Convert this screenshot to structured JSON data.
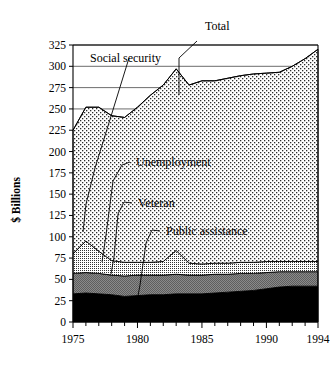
{
  "chart_data": {
    "type": "area",
    "stacked": true,
    "title": "",
    "subtitle": "",
    "xlabel": "",
    "ylabel": "$ Billions",
    "xlim": [
      1975,
      1994
    ],
    "ylim": [
      0,
      325
    ],
    "grid": true,
    "grid_axis": "y",
    "legend_position": "inline-annotations",
    "x": [
      1975,
      1976,
      1977,
      1978,
      1979,
      1980,
      1981,
      1982,
      1983,
      1984,
      1985,
      1986,
      1987,
      1988,
      1989,
      1990,
      1991,
      1992,
      1993,
      1994
    ],
    "categories": [
      "1975",
      "1976",
      "1977",
      "1978",
      "1979",
      "1980",
      "1981",
      "1982",
      "1983",
      "1984",
      "1985",
      "1986",
      "1987",
      "1988",
      "1989",
      "1990",
      "1991",
      "1992",
      "1993",
      "1994"
    ],
    "xticks": [
      1975,
      1980,
      1985,
      1990,
      1994
    ],
    "xticklabels": [
      "1975",
      "1980",
      "1985",
      "1990",
      "1994"
    ],
    "yticks": [
      0,
      25,
      50,
      75,
      100,
      125,
      150,
      175,
      200,
      225,
      250,
      275,
      300,
      325
    ],
    "yticklabels": [
      "0",
      "25",
      "50",
      "75",
      "100",
      "125",
      "150",
      "175",
      "200",
      "225",
      "250",
      "275",
      "300",
      "325"
    ],
    "series": [
      {
        "name": "Public assistance",
        "fill": "#000000",
        "pattern": "solid-black",
        "values": [
          33,
          34,
          33,
          32,
          30,
          31,
          32,
          32,
          33,
          33,
          33,
          34,
          35,
          36,
          37,
          39,
          41,
          42,
          42,
          42
        ]
      },
      {
        "name": "Veteran",
        "fill": "#767676",
        "pattern": "dense-checker-gray",
        "values": [
          24,
          24,
          24,
          23,
          24,
          24,
          23,
          23,
          23,
          22,
          22,
          22,
          21,
          21,
          20,
          19,
          18,
          17,
          17,
          17
        ]
      },
      {
        "name": "Unemployment",
        "fill": "#d8d8d8",
        "pattern": "fine-dot",
        "values": [
          23,
          37,
          26,
          17,
          16,
          15,
          15,
          16,
          28,
          14,
          13,
          13,
          13,
          13,
          13,
          13,
          12,
          12,
          12,
          12
        ]
      },
      {
        "name": "Social security",
        "fill": "#e8e8e8",
        "pattern": "sparse-dot",
        "values": [
          145,
          157,
          169,
          170,
          170,
          182,
          196,
          207,
          213,
          209,
          215,
          214,
          217,
          219,
          221,
          221,
          222,
          229,
          238,
          249
        ]
      }
    ],
    "totals": [
      225,
      252,
      252,
      242,
      240,
      252,
      266,
      278,
      297,
      278,
      283,
      283,
      286,
      289,
      291,
      292,
      293,
      300,
      309,
      320
    ],
    "annotations": [
      {
        "name": "total",
        "label": "Total"
      },
      {
        "name": "social-security",
        "label": "Social security"
      },
      {
        "name": "unemployment",
        "label": "Unemployment"
      },
      {
        "name": "veteran",
        "label": "Veteran"
      },
      {
        "name": "public-assistance",
        "label": "Public assistance"
      }
    ]
  },
  "axes": {
    "y_title": "$ Billions"
  }
}
